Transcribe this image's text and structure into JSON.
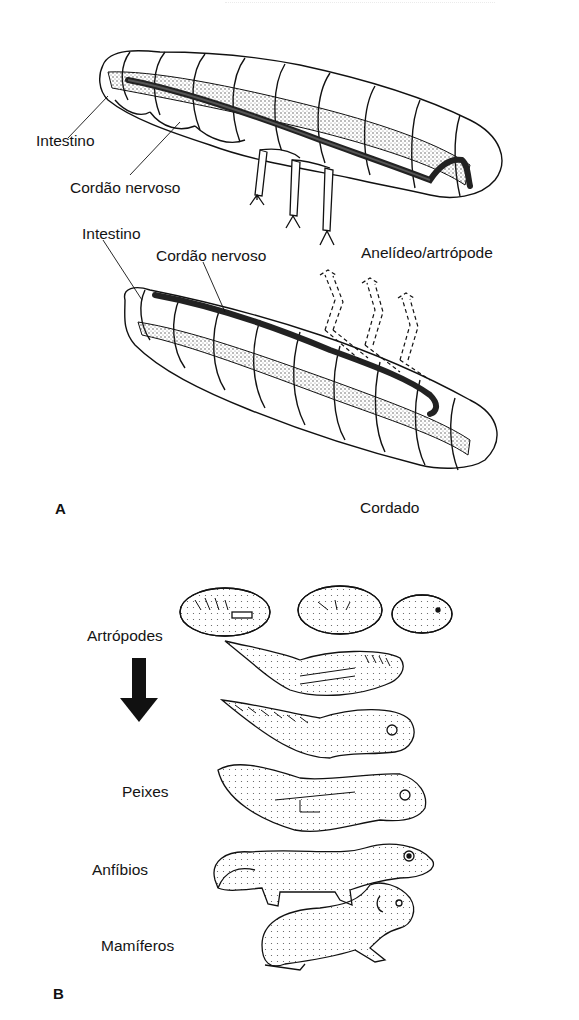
{
  "figure": {
    "panel_a": {
      "label": "A",
      "upper_specimen": {
        "name": "Anelídeo/artrópode",
        "labels": {
          "intestine": "Intestino",
          "nerve_cord": "Cordão nervoso"
        }
      },
      "lower_specimen": {
        "name": "Cordado",
        "labels": {
          "intestine": "Intestino",
          "nerve_cord": "Cordão nervoso"
        }
      }
    },
    "panel_b": {
      "label": "B",
      "sequence_labels": {
        "top": "Artrópodes",
        "fish": "Peixes",
        "amphibians": "Anfíbios",
        "mammals": "Mamíferos"
      },
      "arrow": "down-arrow"
    },
    "colors": {
      "ink": "#111111",
      "background": "#ffffff",
      "stipple": "#555555"
    }
  }
}
